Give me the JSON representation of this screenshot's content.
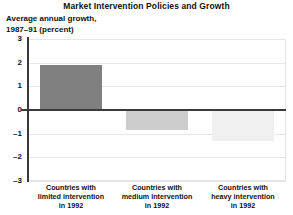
{
  "chart_data": {
    "type": "bar",
    "title": "Market Intervention Policies and Growth",
    "ylabel": "Average annual growth,\n1987–91 (percent)",
    "xlabel": "",
    "categories": [
      "Countries with\nlimited intervention\nin 1992",
      "Countries with\nmedium intervention\nin 1992",
      "Countries with\nheavy intervention\nin 1992"
    ],
    "values": [
      1.9,
      -0.85,
      -1.3
    ],
    "ylim": [
      -3,
      3
    ],
    "yticks": [
      3,
      2,
      1,
      0,
      -1,
      -2,
      -3
    ],
    "ytick_labels": [
      "3",
      "2",
      "1",
      "0",
      "–1",
      "–2",
      "–3"
    ],
    "bar_colors": [
      "#808080",
      "#cccccc",
      "#f0f0f0"
    ],
    "grid": true,
    "legend": "none",
    "zero_line_color": "#3a3a3a",
    "gridline_color": "#e6e6e6"
  }
}
